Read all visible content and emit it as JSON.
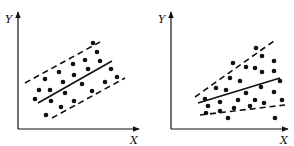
{
  "figure": {
    "panels": [
      {
        "id": "left",
        "y_label": "Y",
        "x_label": "X"
      },
      {
        "id": "right",
        "y_label": "Y",
        "x_label": "X"
      }
    ]
  },
  "chart_data": [
    {
      "type": "scatter",
      "title": "",
      "xlabel": "X",
      "ylabel": "Y",
      "note": "Constant-width band: solid regression line with parallel dashed bounds",
      "points_px": [
        [
          93,
          43
        ],
        [
          97,
          52
        ],
        [
          100,
          61
        ],
        [
          111,
          69
        ],
        [
          117,
          77
        ],
        [
          105,
          82
        ],
        [
          92,
          91
        ],
        [
          73,
          64
        ],
        [
          85,
          60
        ],
        [
          59,
          72
        ],
        [
          45,
          79
        ],
        [
          39,
          90
        ],
        [
          50,
          90
        ],
        [
          35,
          99
        ],
        [
          63,
          82
        ],
        [
          74,
          75
        ],
        [
          88,
          69
        ],
        [
          82,
          84
        ],
        [
          65,
          93
        ],
        [
          51,
          101
        ],
        [
          61,
          107
        ],
        [
          74,
          101
        ],
        [
          46,
          115
        ]
      ],
      "lines_px": {
        "upper_dashed": [
          [
            25,
            83
          ],
          [
            100,
            42
          ]
        ],
        "fit_solid": [
          [
            38,
            103
          ],
          [
            112,
            61
          ]
        ],
        "lower_dashed": [
          [
            52,
            118
          ],
          [
            125,
            78
          ]
        ]
      }
    },
    {
      "type": "scatter",
      "title": "",
      "xlabel": "X",
      "ylabel": "Y",
      "note": "Widening band: solid regression line with diverging dashed bounds",
      "points_px": [
        [
          256,
          48
        ],
        [
          262,
          56
        ],
        [
          274,
          61
        ],
        [
          233,
          63
        ],
        [
          246,
          67
        ],
        [
          255,
          68
        ],
        [
          262,
          72
        ],
        [
          274,
          71
        ],
        [
          230,
          78
        ],
        [
          240,
          81
        ],
        [
          280,
          81
        ],
        [
          216,
          88
        ],
        [
          226,
          90
        ],
        [
          261,
          87
        ],
        [
          246,
          93
        ],
        [
          274,
          92
        ],
        [
          205,
          99
        ],
        [
          208,
          106
        ],
        [
          220,
          102
        ],
        [
          238,
          100
        ],
        [
          255,
          100
        ],
        [
          282,
          100
        ],
        [
          206,
          113
        ],
        [
          220,
          111
        ],
        [
          234,
          108
        ],
        [
          250,
          106
        ],
        [
          264,
          103
        ],
        [
          228,
          118
        ],
        [
          275,
          118
        ]
      ],
      "lines_px": {
        "upper_dashed": [
          [
            195,
            97
          ],
          [
            274,
            41
          ]
        ],
        "fit_solid": [
          [
            198,
            103
          ],
          [
            280,
            78
          ]
        ],
        "lower_dashed": [
          [
            200,
            115
          ],
          [
            285,
            105
          ]
        ]
      }
    }
  ]
}
